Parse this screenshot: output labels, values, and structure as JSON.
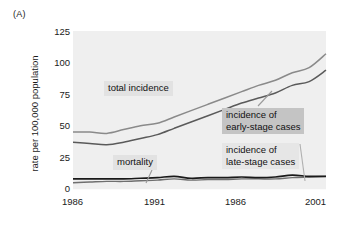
{
  "figure": {
    "panel_label": "(A)"
  },
  "chart_data": {
    "type": "line",
    "title": "",
    "xlabel": "",
    "ylabel": "rate per 100,000 population",
    "xlim": [
      1986,
      2001
    ],
    "ylim": [
      0,
      125
    ],
    "yticks": [
      125,
      100,
      75,
      50,
      25,
      0
    ],
    "xticks": [
      "1986",
      "1991",
      "1986",
      "2001"
    ],
    "xtick_values": [
      1986,
      1991,
      1996,
      2001
    ],
    "grid": false,
    "legend_position": "inline-annotations",
    "x": [
      1986,
      1987,
      1988,
      1989,
      1990,
      1991,
      1992,
      1993,
      1994,
      1995,
      1996,
      1997,
      1998,
      1999,
      2000,
      2001
    ],
    "series": [
      {
        "name": "total incidence",
        "color": "#8a8a8a",
        "values": [
          45,
          45,
          44,
          47,
          50,
          52,
          57,
          62,
          67,
          72,
          77,
          82,
          86,
          92,
          96,
          107
        ]
      },
      {
        "name": "incidence of early-stage cases",
        "color": "#5a5a5a",
        "values": [
          37,
          36,
          35,
          37,
          40,
          43,
          48,
          53,
          58,
          63,
          68,
          72,
          76,
          82,
          85,
          94
        ]
      },
      {
        "name": "incidence of late-stage cases",
        "color": "#6f6f6f",
        "values": [
          5,
          5.5,
          6,
          6,
          6.5,
          7,
          8,
          7,
          7.5,
          7.5,
          8,
          8,
          8,
          9,
          9.5,
          10
        ]
      },
      {
        "name": "mortality",
        "color": "#1a1a1a",
        "values": [
          8,
          8,
          8,
          8,
          8.5,
          9,
          10,
          8.5,
          9,
          9,
          9.5,
          9,
          9.5,
          11,
          10,
          10
        ]
      }
    ],
    "annotations": [
      {
        "label": "total incidence",
        "style": "light"
      },
      {
        "label": "incidence of\nearly-stage cases",
        "style": "mid"
      },
      {
        "label": "incidence of\nlate-stage cases",
        "style": "soft"
      },
      {
        "label": "mortality",
        "style": "light"
      }
    ]
  }
}
